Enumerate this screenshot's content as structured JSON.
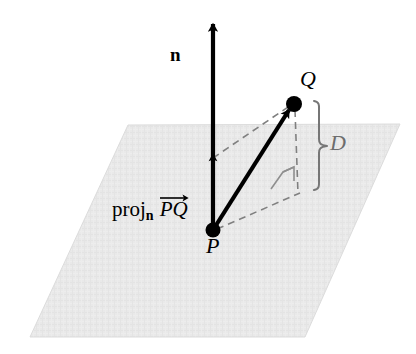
{
  "figure": {
    "type": "geometry-diagram",
    "background_color": "#ffffff"
  },
  "plane": {
    "name": "plane",
    "fill_color": "#e8e8e8",
    "corners": [
      {
        "x": 128,
        "y": 125
      },
      {
        "x": 400,
        "y": 124
      },
      {
        "x": 305,
        "y": 337
      },
      {
        "x": 30,
        "y": 337
      }
    ]
  },
  "points": [
    {
      "id": "P",
      "label": "P",
      "x": 213,
      "y": 230,
      "style": "filled-dot"
    },
    {
      "id": "Q",
      "label": "Q",
      "x": 294,
      "y": 104,
      "style": "filled-dot"
    }
  ],
  "vectors": [
    {
      "id": "n",
      "label": "n",
      "from": {
        "x": 213,
        "y": 230
      },
      "to": {
        "x": 213,
        "y": 20
      },
      "color": "#000000",
      "style": "solid-bold-arrow"
    },
    {
      "id": "PQ",
      "label": "PQ",
      "from": {
        "x": 213,
        "y": 230
      },
      "to": {
        "x": 290,
        "y": 108
      },
      "color": "#000000",
      "style": "solid-bold-arrow"
    }
  ],
  "projection": {
    "label_word": "proj",
    "label_subscript": "n",
    "label_vector": "PQ",
    "tip": {
      "x": 213,
      "y": 158
    },
    "marker": "mid-arrowhead-on-n"
  },
  "dashed_lines": [
    {
      "name": "proj-tip-to-Q",
      "from": {
        "x": 213,
        "y": 158
      },
      "to": {
        "x": 292,
        "y": 105
      }
    },
    {
      "name": "Q-to-foot",
      "from": {
        "x": 294,
        "y": 108
      },
      "to": {
        "x": 297,
        "y": 194
      }
    },
    {
      "name": "P-to-foot",
      "from": {
        "x": 215,
        "y": 229
      },
      "to": {
        "x": 299,
        "y": 193
      }
    }
  ],
  "right_angle_marker": {
    "name": "right-angle-marker",
    "color": "#8a8a8a",
    "vertices": [
      {
        "x": 272,
        "y": 188
      },
      {
        "x": 283,
        "y": 172
      },
      {
        "x": 293,
        "y": 167
      },
      {
        "x": 293,
        "y": 180
      }
    ]
  },
  "brace": {
    "name": "distance-brace",
    "label": "D",
    "color": "#767676",
    "top": {
      "x": 318,
      "y": 101
    },
    "bottom": {
      "x": 318,
      "y": 190
    },
    "tip": {
      "x": 328,
      "y": 146
    }
  },
  "labels": {
    "n": "n",
    "P": "P",
    "Q": "Q",
    "D": "D"
  }
}
